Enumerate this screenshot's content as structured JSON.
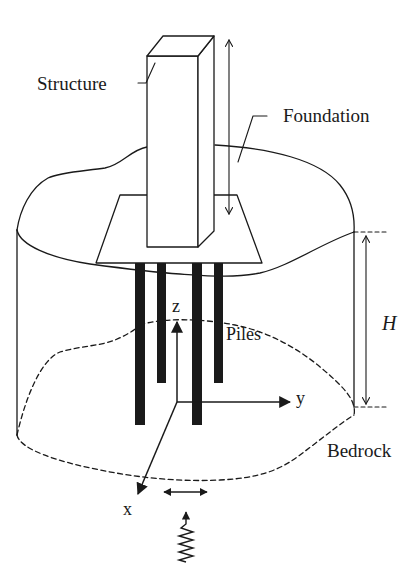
{
  "figure": {
    "type": "schematic",
    "colors": {
      "ink": "#1a1a1a",
      "background": "#ffffff"
    }
  },
  "labels": {
    "structure": "Structure",
    "foundation": "Foundation",
    "piles": "Piles",
    "height": "H",
    "bedrock": "Bedrock",
    "axis_x": "x",
    "axis_y": "y",
    "axis_z": "z"
  },
  "icons": {
    "vertical_motion": "double-arrow-vertical",
    "horizontal_motion": "double-arrow-horizontal",
    "seismic_wave": "squiggle-arrow-up",
    "dimension": "dimension-arrow"
  }
}
